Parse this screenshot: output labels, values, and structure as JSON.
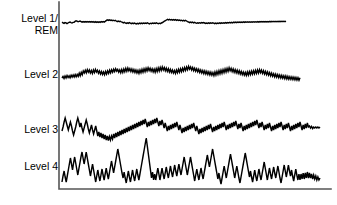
{
  "figure": {
    "background_color": "#ffffff",
    "trace_color": "#000000",
    "axis_color": "#555555",
    "width": 337,
    "height": 205
  },
  "labels": {
    "level1": "Level 1/\nREM",
    "level2": "Level 2",
    "level3": "Level 3",
    "level4": "Level 4"
  },
  "chart_data": {
    "type": "line",
    "title": "",
    "xlabel": "",
    "ylabel": "",
    "grid": false,
    "legend": "none",
    "axes": {
      "left_spine_x": 59,
      "bottom_spine_y": 189,
      "right_edge_x": 331,
      "top_edge_y": 2,
      "ticks": [],
      "tick_labels": []
    },
    "series": [
      {
        "name": "Level 1/REM",
        "label": "Level 1/\nREM",
        "baseline_y": 22,
        "amplitude": "very low",
        "x_start": 62,
        "x_end": 286,
        "values": [
          22.2,
          22.8,
          23.4,
          22.6,
          22.9,
          23.6,
          23.0,
          22.4,
          22.0,
          22.6,
          23.0,
          22.4,
          22.2,
          21.4,
          20.8,
          21.2,
          21.8,
          21.4,
          21.0,
          21.6,
          22.2,
          21.6,
          22.2,
          21.6,
          22.2,
          21.5,
          22.1,
          21.5,
          22.2,
          21.6,
          22.2,
          21.7,
          22.3,
          21.7,
          22.4,
          21.8,
          22.4,
          21.8,
          22.3,
          21.7,
          22.2,
          21.5,
          22.1,
          21.4,
          20.6,
          19.9,
          20.4,
          19.8,
          20.4,
          20.0,
          20.6,
          20.2,
          20.8,
          20.4,
          21.0,
          21.6,
          21.0,
          21.6,
          21.2,
          21.8,
          22.2,
          22.8,
          22.3,
          22.9,
          23.4,
          22.8,
          23.3,
          22.7,
          23.2,
          23.7,
          23.1,
          23.6,
          23.0,
          23.5,
          23.9,
          23.3,
          23.8,
          23.2,
          23.7,
          23.1,
          23.6,
          23.0,
          23.5,
          23.0,
          23.4,
          22.9,
          23.3,
          23.8,
          23.2,
          23.6,
          23.1,
          23.5,
          23.0,
          23.4,
          22.9,
          23.3,
          23.7,
          23.2,
          23.6,
          23.0,
          22.5,
          21.8,
          21.2,
          20.6,
          20.0,
          19.4,
          19.9,
          19.4,
          20.0,
          19.5,
          20.1,
          19.6,
          20.2,
          19.7,
          20.3,
          19.8,
          20.4,
          20.0,
          20.6,
          20.2,
          20.8,
          20.3,
          20.9,
          20.4,
          21.0,
          21.6,
          22.0,
          22.6,
          22.1,
          22.7,
          22.2,
          22.8,
          22.3,
          22.9,
          23.3,
          22.8,
          23.2,
          22.7,
          23.1,
          22.6,
          23.0,
          22.5,
          23.0,
          23.5,
          23.0,
          23.4,
          22.9,
          23.4,
          22.8,
          23.3,
          22.8,
          23.2,
          23.7,
          23.1,
          23.6,
          23.0,
          23.5,
          22.9,
          23.4,
          22.8,
          23.3,
          22.8,
          23.2,
          22.6,
          23.1,
          22.5,
          23.0,
          22.4,
          22.9,
          22.3,
          22.8,
          22.2,
          22.7,
          22.1,
          22.6,
          22.0,
          22.5,
          22.0,
          22.5,
          22.0,
          22.4,
          21.9,
          22.4,
          21.9,
          22.3,
          21.8,
          22.3,
          21.8,
          22.3,
          21.8,
          22.2,
          21.7,
          22.2,
          21.7,
          22.1,
          21.6,
          22.1,
          21.6,
          22.0,
          21.6,
          22.0,
          21.5,
          22.0,
          21.5,
          21.9,
          21.5,
          21.9,
          21.4,
          21.9,
          21.4,
          21.8,
          21.4,
          21.8,
          21.3,
          21.8,
          21.3,
          21.7,
          21.3,
          21.7,
          21.2,
          21.7,
          21.2,
          21.6,
          21.2
        ]
      },
      {
        "name": "Level 2",
        "label": "Level 2",
        "baseline_y": 76,
        "amplitude": "low-moderate",
        "x_start": 62,
        "x_end": 300,
        "values": [
          78.0,
          76.5,
          78.5,
          76.0,
          78.0,
          75.5,
          77.5,
          75.8,
          77.8,
          75.2,
          77.2,
          75.0,
          77.0,
          74.6,
          76.8,
          74.4,
          76.4,
          73.2,
          75.8,
          72.4,
          74.8,
          71.0,
          73.0,
          70.2,
          72.8,
          69.6,
          72.2,
          70.0,
          73.0,
          70.6,
          73.4,
          70.0,
          72.6,
          69.4,
          72.0,
          70.2,
          73.2,
          71.0,
          74.0,
          71.6,
          74.4,
          72.0,
          74.8,
          71.4,
          74.0,
          70.8,
          73.4,
          70.2,
          72.8,
          69.8,
          72.2,
          69.2,
          71.6,
          68.8,
          71.2,
          69.4,
          72.2,
          70.0,
          72.8,
          69.6,
          72.4,
          69.0,
          71.8,
          68.4,
          71.2,
          68.0,
          70.8,
          68.6,
          71.4,
          69.0,
          72.0,
          69.6,
          72.4,
          70.0,
          73.0,
          70.4,
          73.4,
          70.0,
          72.8,
          69.4,
          72.2,
          68.8,
          71.6,
          68.2,
          71.0,
          67.8,
          70.6,
          68.2,
          71.2,
          68.8,
          71.8,
          69.2,
          72.2,
          68.6,
          71.6,
          68.0,
          71.0,
          67.4,
          70.4,
          67.0,
          70.0,
          67.6,
          70.8,
          68.2,
          71.4,
          68.8,
          72.0,
          69.4,
          72.4,
          70.0,
          73.0,
          70.6,
          73.4,
          70.0,
          72.8,
          69.4,
          72.2,
          68.8,
          71.6,
          68.2,
          71.0,
          67.6,
          70.4,
          67.0,
          69.8,
          66.4,
          69.2,
          67.0,
          70.0,
          67.6,
          70.6,
          68.2,
          71.2,
          68.8,
          71.8,
          69.4,
          72.4,
          70.0,
          73.0,
          70.6,
          73.6,
          71.0,
          74.0,
          71.4,
          74.4,
          71.8,
          74.8,
          72.2,
          75.2,
          72.6,
          75.6,
          72.0,
          75.0,
          71.4,
          74.4,
          70.8,
          73.8,
          70.2,
          73.2,
          69.6,
          72.6,
          69.0,
          72.0,
          68.4,
          71.4,
          67.8,
          70.8,
          68.4,
          71.6,
          69.0,
          72.2,
          69.6,
          72.8,
          70.2,
          73.4,
          70.8,
          74.0,
          71.4,
          74.6,
          72.0,
          75.0,
          72.4,
          75.4,
          72.0,
          75.0,
          71.6,
          74.6,
          71.2,
          74.2,
          70.8,
          73.8,
          70.4,
          73.4,
          70.0,
          73.0,
          69.6,
          72.6,
          70.2,
          73.4,
          70.8,
          74.0,
          71.4,
          74.6,
          72.0,
          75.2,
          72.6,
          75.8,
          73.2,
          76.2,
          73.8,
          76.8,
          74.2,
          77.2,
          74.6,
          77.6,
          75.0,
          78.0,
          75.4,
          78.2,
          75.8,
          78.6,
          76.0,
          79.0,
          76.4,
          79.2,
          76.8,
          79.4,
          77.0,
          79.6,
          77.2,
          79.8,
          77.4,
          80.0,
          77.6,
          80.2,
          77.8
        ]
      },
      {
        "name": "Level 3",
        "label": "Level 3",
        "baseline_y": 127,
        "amplitude": "moderate-high",
        "x_start": 62,
        "x_end": 320,
        "values": [
          131.0,
          127.0,
          122.0,
          118.0,
          122.0,
          126.0,
          130.0,
          126.0,
          122.0,
          126.0,
          131.0,
          135.0,
          131.0,
          127.0,
          122.0,
          118.0,
          122.0,
          127.0,
          123.0,
          128.0,
          132.0,
          128.0,
          124.0,
          120.0,
          124.0,
          129.0,
          133.0,
          129.0,
          125.0,
          130.0,
          134.0,
          130.0,
          126.0,
          131.0,
          136.0,
          132.0,
          137.0,
          133.0,
          138.0,
          134.0,
          139.0,
          135.0,
          140.0,
          136.0,
          140.5,
          136.5,
          140.0,
          136.0,
          139.0,
          134.0,
          138.0,
          133.0,
          137.0,
          132.0,
          136.0,
          131.0,
          135.0,
          130.0,
          134.0,
          129.0,
          133.0,
          128.0,
          132.0,
          127.0,
          131.0,
          126.0,
          130.0,
          125.0,
          129.0,
          124.0,
          128.0,
          123.0,
          127.0,
          122.0,
          126.0,
          121.0,
          125.0,
          120.0,
          124.0,
          119.0,
          123.0,
          127.0,
          122.0,
          126.0,
          121.0,
          125.0,
          120.0,
          124.0,
          119.0,
          123.0,
          118.0,
          122.0,
          126.0,
          121.0,
          125.0,
          120.0,
          124.0,
          128.0,
          123.0,
          127.0,
          131.0,
          126.0,
          130.0,
          125.0,
          129.0,
          124.0,
          128.0,
          123.0,
          127.0,
          122.0,
          126.0,
          130.0,
          125.0,
          129.0,
          133.0,
          128.0,
          132.0,
          127.0,
          131.0,
          126.0,
          130.0,
          125.0,
          129.0,
          124.0,
          128.0,
          123.0,
          127.0,
          131.0,
          126.0,
          130.0,
          134.0,
          129.0,
          133.0,
          128.0,
          132.0,
          127.0,
          131.0,
          126.0,
          130.0,
          125.0,
          129.0,
          124.0,
          128.0,
          132.0,
          127.0,
          131.0,
          126.0,
          130.0,
          125.0,
          129.0,
          124.0,
          128.0,
          123.0,
          127.0,
          122.0,
          126.0,
          130.0,
          125.0,
          129.0,
          124.0,
          128.0,
          123.0,
          127.0,
          122.0,
          126.0,
          121.0,
          125.0,
          129.0,
          124.0,
          128.0,
          123.0,
          127.0,
          131.0,
          126.0,
          130.0,
          125.0,
          129.0,
          124.0,
          128.0,
          123.0,
          127.0,
          122.0,
          126.0,
          121.0,
          125.0,
          120.0,
          124.0,
          128.0,
          123.0,
          127.0,
          122.0,
          126.0,
          130.0,
          125.0,
          129.0,
          124.0,
          128.0,
          123.0,
          127.0,
          131.0,
          126.0,
          130.0,
          125.0,
          129.0,
          124.0,
          128.0,
          123.0,
          127.0,
          122.0,
          126.0,
          130.0,
          125.0,
          129.0,
          124.0,
          128.0,
          123.0,
          127.0,
          131.0,
          126.0,
          130.0,
          125.0,
          129.0,
          124.0,
          128.0,
          123.0,
          127.0,
          122.0,
          126.0,
          130.0,
          125.0,
          129.0,
          124.0,
          128.0,
          123.0,
          127.0,
          126.0,
          128.0,
          126.5,
          128.5,
          127.0,
          128.0,
          127.0,
          128.0,
          127.0,
          128.0,
          127.0
        ]
      },
      {
        "name": "Level 4",
        "label": "Level 4",
        "baseline_y": 168,
        "amplitude": "high",
        "x_start": 62,
        "x_end": 320,
        "values": [
          182.0,
          176.0,
          171.0,
          177.0,
          182.0,
          176.0,
          170.0,
          164.0,
          158.0,
          164.0,
          170.0,
          163.0,
          157.0,
          163.0,
          169.0,
          175.0,
          169.0,
          163.0,
          157.0,
          152.0,
          158.0,
          164.0,
          158.0,
          152.0,
          158.0,
          164.0,
          170.0,
          176.0,
          170.0,
          164.0,
          170.0,
          176.0,
          182.0,
          176.0,
          170.0,
          176.0,
          181.0,
          175.0,
          169.0,
          175.0,
          180.0,
          174.0,
          168.0,
          174.0,
          179.0,
          173.0,
          167.0,
          161.0,
          167.0,
          173.0,
          167.0,
          161.0,
          155.0,
          149.0,
          155.0,
          161.0,
          167.0,
          173.0,
          178.0,
          172.0,
          178.0,
          183.0,
          177.0,
          171.0,
          177.0,
          182.0,
          176.0,
          170.0,
          176.0,
          181.0,
          175.0,
          169.0,
          175.0,
          180.0,
          174.0,
          168.0,
          162.0,
          156.0,
          150.0,
          144.0,
          138.0,
          146.0,
          154.0,
          162.0,
          170.0,
          178.0,
          172.0,
          180.0,
          174.0,
          180.0,
          174.0,
          168.0,
          174.0,
          180.0,
          174.0,
          168.0,
          174.0,
          179.0,
          173.0,
          167.0,
          173.0,
          178.0,
          172.0,
          166.0,
          172.0,
          177.0,
          171.0,
          165.0,
          171.0,
          176.0,
          170.0,
          164.0,
          170.0,
          175.0,
          169.0,
          163.0,
          157.0,
          163.0,
          169.0,
          175.0,
          169.0,
          163.0,
          157.0,
          163.0,
          169.0,
          175.0,
          181.0,
          175.0,
          169.0,
          175.0,
          180.0,
          174.0,
          168.0,
          174.0,
          179.0,
          173.0,
          167.0,
          161.0,
          155.0,
          161.0,
          167.0,
          161.0,
          155.0,
          149.0,
          155.0,
          161.0,
          167.0,
          173.0,
          179.0,
          173.0,
          179.0,
          184.0,
          178.0,
          172.0,
          166.0,
          172.0,
          178.0,
          172.0,
          166.0,
          160.0,
          154.0,
          160.0,
          166.0,
          172.0,
          178.0,
          172.0,
          166.0,
          172.0,
          178.0,
          183.0,
          177.0,
          171.0,
          165.0,
          159.0,
          153.0,
          159.0,
          165.0,
          171.0,
          177.0,
          171.0,
          177.0,
          182.0,
          176.0,
          170.0,
          176.0,
          181.0,
          175.0,
          169.0,
          175.0,
          180.0,
          174.0,
          168.0,
          162.0,
          168.0,
          174.0,
          180.0,
          174.0,
          168.0,
          174.0,
          179.0,
          173.0,
          167.0,
          173.0,
          178.0,
          172.0,
          166.0,
          172.0,
          178.0,
          183.0,
          177.0,
          171.0,
          165.0,
          171.0,
          177.0,
          171.0,
          165.0,
          171.0,
          176.0,
          170.0,
          176.0,
          181.0,
          175.0,
          169.0,
          175.0,
          180.0,
          174.0,
          180.0,
          174.0,
          179.0,
          173.0,
          179.0,
          173.0,
          178.0,
          172.0,
          178.0,
          173.0,
          178.0,
          174.0,
          179.0,
          175.0,
          179.0,
          176.0,
          180.0,
          177.0,
          180.0,
          178.0
        ]
      }
    ]
  }
}
